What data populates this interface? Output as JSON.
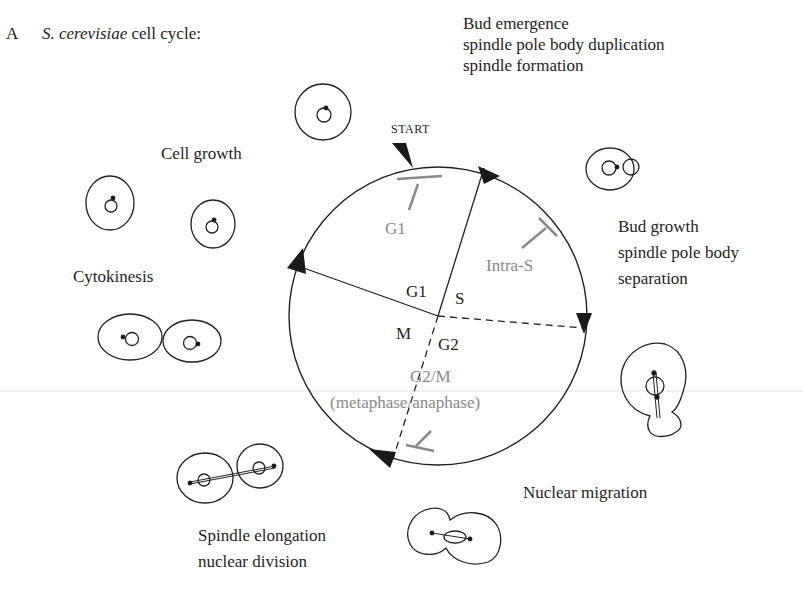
{
  "panel_label": "A",
  "title": {
    "organism": "S. cerevisiae",
    "rest": "cell cycle:"
  },
  "checkpoint_marker": "START",
  "phases": {
    "g1": "G1",
    "s": "S",
    "g2": "G2",
    "m": "M"
  },
  "checkpoints": {
    "g1": "G1",
    "intra_s": "Intra-S",
    "g2m": "G2/M",
    "g2m_sub": "(metaphase/anaphase)"
  },
  "stage_labels": {
    "bud_emergence": [
      "Bud emergence",
      "spindle pole body duplication",
      "spindle formation"
    ],
    "bud_growth": [
      "Bud growth",
      "spindle pole body",
      "separation"
    ],
    "nuclear_migration": "Nuclear migration",
    "spindle_elongation": [
      "Spindle elongation",
      "nuclear division"
    ],
    "cytokinesis": "Cytokinesis",
    "cell_growth": "Cell growth"
  },
  "colors": {
    "line": "#222222",
    "checkpoint": "#8a8a8a"
  }
}
